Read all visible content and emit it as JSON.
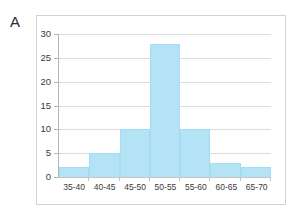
{
  "figure": {
    "panel_label": "A",
    "background_color": "#ffffff",
    "frame_color": "#d2d2d2"
  },
  "chart_data": {
    "type": "bar",
    "title": "",
    "subtitle": "",
    "xlabel": "",
    "ylabel": "",
    "categories": [
      "35-40",
      "40-45",
      "45-50",
      "50-55",
      "55-60",
      "60-65",
      "65-70"
    ],
    "values": [
      2,
      5,
      10,
      28,
      10,
      3,
      2
    ],
    "ylim": [
      0,
      30
    ],
    "yticks": [
      0,
      5,
      10,
      15,
      20,
      25,
      30
    ],
    "ytick_labels": [
      "0",
      "5",
      "10",
      "15",
      "20",
      "25",
      "30"
    ],
    "grid": true,
    "grid_axis": "y",
    "legend": false,
    "legend_position": "none",
    "bar_gap": 0,
    "bar_color": "#b3e3f5",
    "bar_edge_color": "#a5dcf1",
    "gridline_color": "#dcdcdc",
    "axis_color": "#b5b5b5",
    "annotations": []
  }
}
